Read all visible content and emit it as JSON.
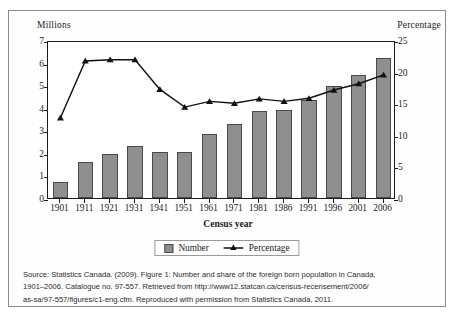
{
  "chart_data": {
    "type": "bar",
    "title": "",
    "xlabel": "Census year",
    "ylabel": "Millions",
    "ylabel_right": "Percentage",
    "categories": [
      "1901",
      "1911",
      "1921",
      "1931",
      "1941",
      "1951",
      "1961",
      "1971",
      "1981",
      "1986",
      "1991",
      "1996",
      "2001",
      "2006"
    ],
    "ylim": [
      0,
      7
    ],
    "ylim_right": [
      0,
      25
    ],
    "yticks": [
      "0",
      "1",
      "2",
      "3",
      "4",
      "5",
      "6",
      "7"
    ],
    "yticks_right": [
      "0",
      "5",
      "10",
      "15",
      "20",
      "25"
    ],
    "grid": false,
    "legend_position": "bottom",
    "series": [
      {
        "name": "Number",
        "axis": "left",
        "units": "millions",
        "type": "bar",
        "color": "#8f8f8f",
        "values": [
          0.7,
          1.59,
          1.96,
          2.31,
          2.02,
          2.06,
          2.84,
          3.3,
          3.84,
          3.91,
          4.34,
          4.97,
          5.45,
          6.19
        ]
      },
      {
        "name": "Percentage",
        "axis": "right",
        "units": "percent",
        "type": "line",
        "color": "#111111",
        "marker": "triangle",
        "values": [
          13.0,
          22.0,
          22.2,
          22.2,
          17.5,
          14.7,
          15.6,
          15.3,
          16.0,
          15.6,
          16.1,
          17.4,
          18.4,
          19.8
        ]
      }
    ]
  },
  "legend": {
    "items": [
      {
        "label": "Number",
        "marker": "square-swatch"
      },
      {
        "label": "Percentage",
        "marker": "line-triangle"
      }
    ]
  },
  "source": {
    "line1": "Source: Statistics Canada. (2009). Figure 1: Number and share of the foreign born population in Canada,",
    "line2": "1901–2006. Catalogue no. 97-557. Retrieved from http://www12.statcan.ca/census-recensement/2006/",
    "line3": "as-sa/97-557/figures/c1-eng.cfm. Reproduced with permission from Statistics Canada, 2011."
  }
}
